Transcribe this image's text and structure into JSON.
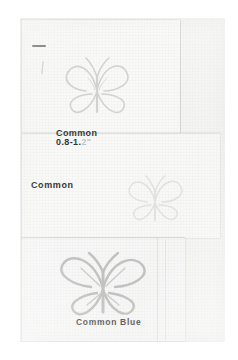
{
  "document": {
    "type": "scanned-notebook-page",
    "medium": "pencil drawing on paper",
    "background_color": "#f7f7f6",
    "ink_color": "#2f2f2f"
  },
  "panels": [
    {
      "name": "top-panel"
    },
    {
      "name": "middle-panel"
    },
    {
      "name": "bottom-panel"
    }
  ],
  "specimens": [
    {
      "id": "specimen-top",
      "label": "Common",
      "measurement": "0.8-1.",
      "measurement_faded_suffix": "2\"",
      "drawing": "butterfly-sketch"
    },
    {
      "id": "specimen-middle",
      "label": "Common",
      "measurement": "",
      "drawing": "butterfly-sketch"
    },
    {
      "id": "specimen-bottom",
      "label": "Common Blue",
      "measurement": "",
      "drawing": "butterfly-sketch"
    }
  ],
  "marks": {
    "ink_dash": "short horizontal ink dash",
    "ink_stroke": "faint vertical pencil stroke"
  }
}
